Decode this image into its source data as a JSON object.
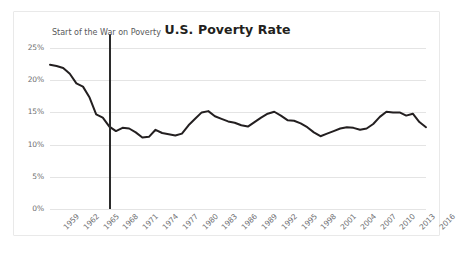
{
  "card": {
    "background_color": "#ffffff",
    "border_color": "#e9e9e9"
  },
  "caption": {
    "text": ""
  },
  "annotation": {
    "label": "Start of the War on Poverty",
    "year": 1968,
    "color": "#2b2b2b"
  },
  "chart_data": {
    "type": "line",
    "title": "U.S. Poverty Rate",
    "subtitle": "",
    "xlabel": "",
    "ylabel": "",
    "ylim": [
      0,
      25
    ],
    "yticks": [
      0,
      5,
      10,
      15,
      20,
      25
    ],
    "ytick_labels": [
      "0%",
      "5%",
      "10%",
      "15%",
      "20%",
      "25%"
    ],
    "xlim": [
      1959,
      2016
    ],
    "xtick_labels": [
      "1959",
      "1962",
      "1965",
      "1968",
      "1971",
      "1974",
      "1977",
      "1980",
      "1983",
      "1986",
      "1989",
      "1992",
      "1995",
      "1998",
      "2001",
      "2004",
      "2007",
      "2010",
      "2013",
      "2016"
    ],
    "xticks": [
      1959,
      1962,
      1965,
      1968,
      1971,
      1974,
      1977,
      1980,
      1983,
      1986,
      1989,
      1992,
      1995,
      1998,
      2001,
      2004,
      2007,
      2010,
      2013,
      2016
    ],
    "grid": true,
    "legend": false,
    "line_color": "#231f20",
    "x": [
      1959,
      1960,
      1961,
      1962,
      1963,
      1964,
      1965,
      1966,
      1967,
      1968,
      1969,
      1970,
      1971,
      1972,
      1973,
      1974,
      1975,
      1976,
      1977,
      1978,
      1979,
      1980,
      1981,
      1982,
      1983,
      1984,
      1985,
      1986,
      1987,
      1988,
      1989,
      1990,
      1991,
      1992,
      1993,
      1994,
      1995,
      1996,
      1997,
      1998,
      1999,
      2000,
      2001,
      2002,
      2003,
      2004,
      2005,
      2006,
      2007,
      2008,
      2009,
      2010,
      2011,
      2012,
      2013,
      2014,
      2015,
      2016
    ],
    "values": [
      22.4,
      22.2,
      21.9,
      21.0,
      19.5,
      19.0,
      17.3,
      14.7,
      14.2,
      12.8,
      12.1,
      12.6,
      12.5,
      11.9,
      11.1,
      11.2,
      12.3,
      11.8,
      11.6,
      11.4,
      11.7,
      13.0,
      14.0,
      15.0,
      15.2,
      14.4,
      14.0,
      13.6,
      13.4,
      13.0,
      12.8,
      13.5,
      14.2,
      14.8,
      15.1,
      14.5,
      13.8,
      13.7,
      13.3,
      12.7,
      11.9,
      11.3,
      11.7,
      12.1,
      12.5,
      12.7,
      12.6,
      12.3,
      12.5,
      13.2,
      14.3,
      15.1,
      15.0,
      15.0,
      14.5,
      14.8,
      13.5,
      12.7
    ]
  }
}
